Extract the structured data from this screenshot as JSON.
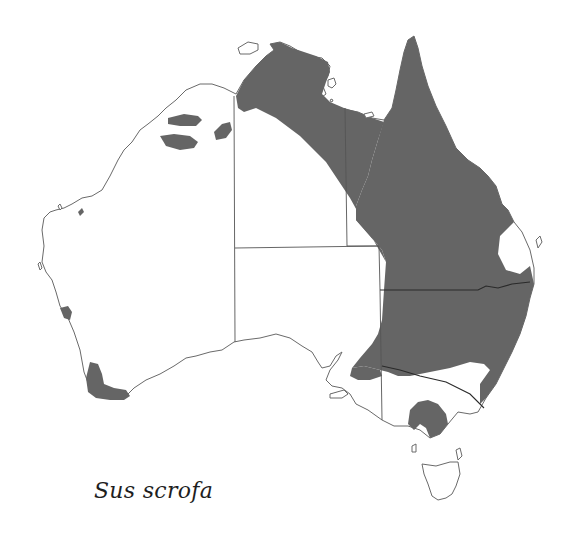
{
  "map": {
    "type": "species-distribution",
    "region": "Australia",
    "species_label": "Sus scrofa",
    "colors": {
      "distribution_fill": "#656565",
      "land_fill": "#ffffff",
      "coastline": "#6a6a6a",
      "state_borders": "#555555"
    },
    "layers": [
      "coastline",
      "state-borders",
      "distribution-range",
      "islands"
    ]
  }
}
